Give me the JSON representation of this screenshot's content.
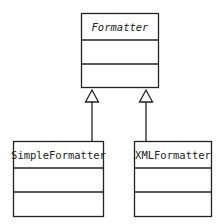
{
  "diagram": {
    "type": "uml-class-diagram",
    "classes": [
      {
        "id": "formatter",
        "name": "Formatter",
        "abstract": true,
        "attributes": [],
        "operations": []
      },
      {
        "id": "simple",
        "name": "SimpleFormatter",
        "abstract": false,
        "attributes": [],
        "operations": []
      },
      {
        "id": "xml",
        "name": "XMLFormatter",
        "abstract": false,
        "attributes": [],
        "operations": []
      }
    ],
    "relations": [
      {
        "type": "generalization",
        "from": "SimpleFormatter",
        "to": "Formatter"
      },
      {
        "type": "generalization",
        "from": "XMLFormatter",
        "to": "Formatter"
      }
    ],
    "colors": {
      "stroke": "#222222",
      "background": "#ffffff"
    }
  }
}
